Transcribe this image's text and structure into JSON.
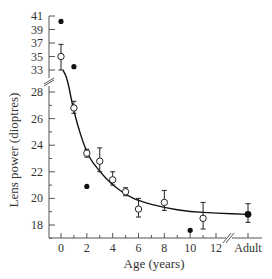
{
  "chart_data": {
    "type": "scatter",
    "title": "",
    "xlabel": "Age (years)",
    "ylabel": "Lens power (dioptres)",
    "x_tick_labels": [
      "0",
      "2",
      "4",
      "6",
      "8",
      "10",
      "12",
      "Adult"
    ],
    "y_tick_labels_lower": [
      "18",
      "20",
      "22",
      "24",
      "26",
      "28"
    ],
    "y_tick_labels_upper": [
      "33",
      "35",
      "37",
      "39",
      "41"
    ],
    "y_axis_break": "between 28 and 33",
    "x_axis_break": "between 12 and Adult",
    "grid": false,
    "legend": null,
    "series": [
      {
        "name": "Mean (open circles, ±error)",
        "marker": "open-circle",
        "points": [
          {
            "x": 0,
            "y": 35.0,
            "low": 33.0,
            "high": 36.8
          },
          {
            "x": 1,
            "y": 26.8,
            "low": 26.4,
            "high": 27.3
          },
          {
            "x": 2,
            "y": 23.4,
            "low": 23.1,
            "high": 23.7
          },
          {
            "x": 3,
            "y": 22.8,
            "low": 22.0,
            "high": 23.8
          },
          {
            "x": 4,
            "y": 21.4,
            "low": 21.0,
            "high": 22.0
          },
          {
            "x": 5,
            "y": 20.5,
            "low": 20.2,
            "high": 20.8
          },
          {
            "x": 6,
            "y": 19.2,
            "low": 18.6,
            "high": 20.0
          },
          {
            "x": 8,
            "y": 19.7,
            "low": 19.1,
            "high": 20.6
          },
          {
            "x": 11,
            "y": 18.5,
            "low": 17.7,
            "high": 19.7
          }
        ]
      },
      {
        "name": "Adult mean",
        "marker": "filled-circle-large",
        "points": [
          {
            "x": "Adult",
            "y": 18.8,
            "low": 18.2,
            "high": 19.6
          }
        ]
      },
      {
        "name": "Individual values (filled dots)",
        "marker": "filled-dot",
        "points": [
          {
            "x": 0,
            "y": 40.2
          },
          {
            "x": 1,
            "y": 33.5
          },
          {
            "x": 2,
            "y": 20.9
          },
          {
            "x": 10,
            "y": 17.6
          }
        ]
      },
      {
        "name": "Fitted curve",
        "marker": "line",
        "points": [
          {
            "x": 0.15,
            "y": 33.0
          },
          {
            "x": 0.5,
            "y": 29.0
          },
          {
            "x": 1,
            "y": 26.4
          },
          {
            "x": 2,
            "y": 23.3
          },
          {
            "x": 3,
            "y": 22.0
          },
          {
            "x": 4,
            "y": 21.0
          },
          {
            "x": 5,
            "y": 20.3
          },
          {
            "x": 6,
            "y": 19.8
          },
          {
            "x": 8,
            "y": 19.3
          },
          {
            "x": 10,
            "y": 19.0
          },
          {
            "x": 12,
            "y": 18.9
          },
          {
            "x": "Adult",
            "y": 18.8
          }
        ]
      }
    ]
  },
  "layout": {
    "axis_color": "#555555",
    "marker_color": "#111111"
  }
}
